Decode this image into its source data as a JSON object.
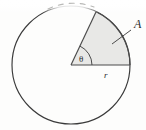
{
  "figure": {
    "kind": "geometry-diagram",
    "width": 146,
    "height": 130,
    "background_color": "#fdfdfc"
  },
  "labels": {
    "area": "A",
    "radius": "r",
    "angle": "θ"
  },
  "colors": {
    "stroke": "#3a3a3a",
    "sector_fill": "#e8e8e6",
    "sector_stroke": "#4a4a4a",
    "label_color": "#2b2b2b",
    "arc_faded": "#b9b9b7"
  },
  "geometry": {
    "center_x": 71,
    "center_y": 65,
    "radius_px": 59,
    "sector_start_angle_deg": 0,
    "sector_end_angle_deg": 65,
    "angle_arc_radius_px": 21,
    "radius_line_end_x": 130,
    "radius_line_end_y": 65,
    "sector_edge_end_x": 96,
    "sector_edge_end_y": 12
  },
  "annotations": {
    "leader_line": {
      "from_x": 139,
      "from_y": 26,
      "to_x": 112,
      "to_y": 44
    },
    "label_A_x": 134,
    "label_A_y": 27,
    "label_r_x": 104,
    "label_r_y": 77,
    "label_theta_x": 80,
    "label_theta_y": 61
  },
  "artifact": {
    "description": "scan-fade-top-arc",
    "region_y_top": 0,
    "region_y_bottom": 13
  }
}
